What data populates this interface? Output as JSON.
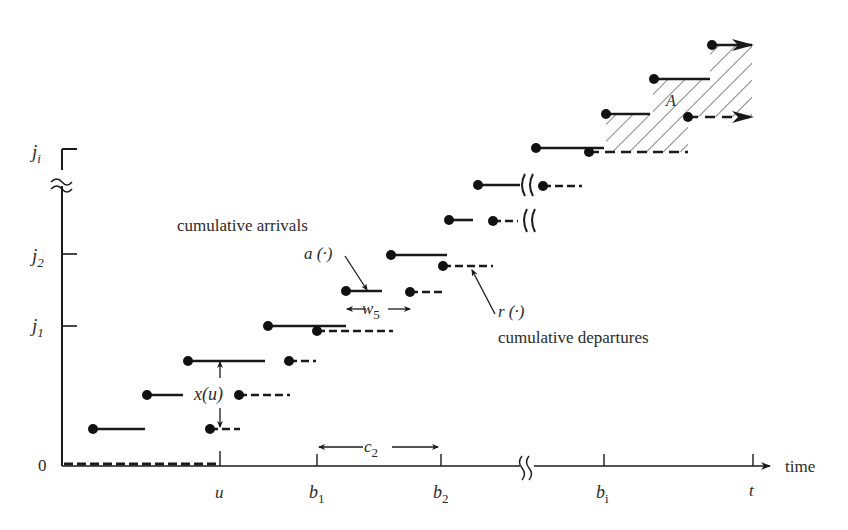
{
  "figure": {
    "type": "diagram",
    "colors": {
      "ink": "#1a1a1a",
      "text": "#2a2a2a",
      "background": "#ffffff"
    }
  },
  "axes": {
    "y_origin_label": "0",
    "y_ticks": [
      {
        "label_main": "j",
        "label_sub": "1",
        "y": 326
      },
      {
        "label_main": "j",
        "label_sub": "2",
        "y": 254
      },
      {
        "label_main": "j",
        "label_sub": "i",
        "y": 149
      }
    ],
    "x_axis_label": "time",
    "x_ticks": [
      {
        "label_main": "u",
        "label_sub": "",
        "x": 220
      },
      {
        "label_main": "b",
        "label_sub": "1",
        "x": 317
      },
      {
        "label_main": "b",
        "label_sub": "2",
        "x": 441
      },
      {
        "label_main": "b",
        "label_sub": "i",
        "x": 604
      },
      {
        "label_main": "t",
        "label_sub": "",
        "x": 753
      }
    ]
  },
  "annotations": {
    "arrivals_title": "cumulative arrivals",
    "arrivals_fn": "a (·)",
    "departures_fn": "r (·)",
    "departures_title": "cumulative departures",
    "queue_length": "x(u)",
    "wait_main": "w",
    "wait_sub": "5",
    "cycle_main": "c",
    "cycle_sub": "2",
    "area_label": "A"
  }
}
